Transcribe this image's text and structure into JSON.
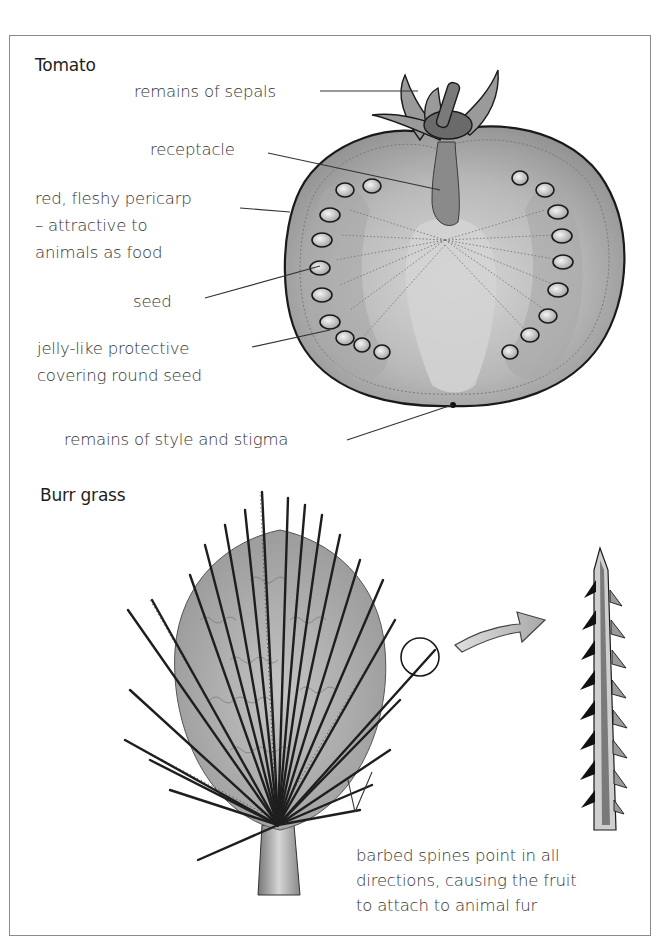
{
  "diagram": {
    "colors": {
      "frame": "#8a8a8a",
      "ink": "#1a1a1a",
      "label_text": "#333333",
      "tomato_flesh": "#b5b5b5",
      "tomato_core": "#d2d2d2",
      "arrow_fill": "#c8c8c8"
    },
    "sections": [
      {
        "title": "Tomato",
        "labels": [
          {
            "id": "sepals",
            "text": "remains of sepals"
          },
          {
            "id": "receptacle",
            "text": "receptacle"
          },
          {
            "id": "pericarp_line1",
            "text": "red, fleshy pericarp"
          },
          {
            "id": "pericarp_line2",
            "text": "– attractive to"
          },
          {
            "id": "pericarp_line3",
            "text": "animals as food"
          },
          {
            "id": "seed",
            "text": "seed"
          },
          {
            "id": "jelly_line1",
            "text": "jelly-like protective"
          },
          {
            "id": "jelly_line2",
            "text": "covering round seed"
          },
          {
            "id": "style",
            "text": "remains of style and stigma"
          }
        ]
      },
      {
        "title": "Burr grass",
        "labels": [
          {
            "id": "spines_line1",
            "text": "barbed spines point in all"
          },
          {
            "id": "spines_line2",
            "text": "directions, causing the fruit"
          },
          {
            "id": "spines_line3",
            "text": "to attach to animal fur"
          }
        ]
      }
    ]
  }
}
